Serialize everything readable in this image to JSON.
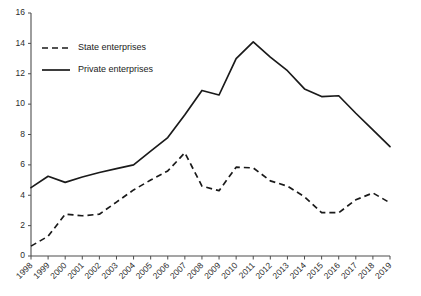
{
  "chart_data": {
    "type": "line",
    "title": "",
    "subtitle": "",
    "xlabel": "",
    "ylabel": "",
    "categories": [
      "1998",
      "1999",
      "2000",
      "2001",
      "2002",
      "2003",
      "2004",
      "2005",
      "2006",
      "2007",
      "2008",
      "2009",
      "2010",
      "2011",
      "2012",
      "2013",
      "2014",
      "2015",
      "2016",
      "2017",
      "2018",
      "2019"
    ],
    "x": [
      1998,
      1999,
      2000,
      2001,
      2002,
      2003,
      2004,
      2005,
      2006,
      2007,
      2008,
      2009,
      2010,
      2011,
      2012,
      2013,
      2014,
      2015,
      2016,
      2017,
      2018,
      2019
    ],
    "ylim": [
      0,
      16
    ],
    "yticks": [
      0,
      2,
      4,
      6,
      8,
      10,
      12,
      14,
      16
    ],
    "ytick_labels": [
      "0",
      "2",
      "4",
      "6",
      "8",
      "10",
      "12",
      "14",
      "16"
    ],
    "grid": false,
    "legend_position": "upper-left-inside",
    "series": [
      {
        "name": "State enterprises",
        "style": "dashed",
        "color": "#1a1a1a",
        "values": [
          0.65,
          1.3,
          2.75,
          2.65,
          2.75,
          3.55,
          4.35,
          5.0,
          5.6,
          6.8,
          4.6,
          4.3,
          5.85,
          5.8,
          4.95,
          4.6,
          3.9,
          2.85,
          2.85,
          3.7,
          4.15,
          3.5
        ]
      },
      {
        "name": "Private enterprises",
        "style": "solid",
        "color": "#1a1a1a",
        "values": [
          4.5,
          5.25,
          4.85,
          5.2,
          5.5,
          5.75,
          6.0,
          6.9,
          7.8,
          9.3,
          10.9,
          10.6,
          13.0,
          14.1,
          13.1,
          12.2,
          11.0,
          10.5,
          10.55,
          9.4,
          8.3,
          7.2
        ]
      }
    ],
    "legend": [
      {
        "label": "State enterprises",
        "style": "dashed"
      },
      {
        "label": "Private enterprises",
        "style": "solid"
      }
    ]
  }
}
